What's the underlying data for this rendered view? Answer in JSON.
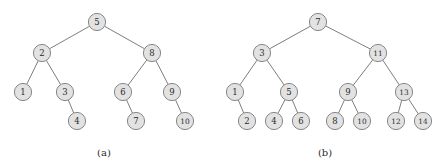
{
  "figure": {
    "background_color": "#ffffff",
    "node_fill_color": "#e2e2e2",
    "node_stroke_color": "#7a7a7a",
    "edge_color": "#6e6e6e",
    "text_color": "#2b2b2b",
    "node_radius": 8.6
  },
  "chart_data": {
    "type": "diagram",
    "title": "",
    "subtitle": "",
    "xlabel": "",
    "ylabel": "",
    "diagram_kind": "binary-tree",
    "panels": [
      {
        "id": "panel-a",
        "caption": "(a)",
        "caption_x": 104,
        "caption_y": 152,
        "root": 5,
        "nodes": [
          {
            "id": "a5",
            "label": "5",
            "x": 97,
            "y": 22
          },
          {
            "id": "a2",
            "label": "2",
            "x": 42,
            "y": 53
          },
          {
            "id": "a8",
            "label": "8",
            "x": 152,
            "y": 53
          },
          {
            "id": "a1",
            "label": "1",
            "x": 23,
            "y": 92
          },
          {
            "id": "a3",
            "label": "3",
            "x": 65,
            "y": 92
          },
          {
            "id": "a6",
            "label": "6",
            "x": 123,
            "y": 92
          },
          {
            "id": "a9",
            "label": "9",
            "x": 172,
            "y": 92
          },
          {
            "id": "a4",
            "label": "4",
            "x": 77,
            "y": 121
          },
          {
            "id": "a7",
            "label": "7",
            "x": 136,
            "y": 121
          },
          {
            "id": "a10",
            "label": "10",
            "x": 185,
            "y": 121
          }
        ],
        "edges": [
          {
            "from": "a5",
            "to": "a2"
          },
          {
            "from": "a5",
            "to": "a8"
          },
          {
            "from": "a2",
            "to": "a1"
          },
          {
            "from": "a2",
            "to": "a3"
          },
          {
            "from": "a8",
            "to": "a6"
          },
          {
            "from": "a8",
            "to": "a9"
          },
          {
            "from": "a3",
            "to": "a4"
          },
          {
            "from": "a6",
            "to": "a7"
          },
          {
            "from": "a9",
            "to": "a10"
          }
        ]
      },
      {
        "id": "panel-b",
        "caption": "(b)",
        "caption_x": 325,
        "caption_y": 152,
        "root": 7,
        "nodes": [
          {
            "id": "b7",
            "label": "7",
            "x": 318,
            "y": 22
          },
          {
            "id": "b3",
            "label": "3",
            "x": 262,
            "y": 53
          },
          {
            "id": "b11",
            "label": "11",
            "x": 378,
            "y": 53
          },
          {
            "id": "b1",
            "label": "1",
            "x": 235,
            "y": 92
          },
          {
            "id": "b5",
            "label": "5",
            "x": 289,
            "y": 92
          },
          {
            "id": "b9",
            "label": "9",
            "x": 348,
            "y": 92
          },
          {
            "id": "b13",
            "label": "13",
            "x": 404,
            "y": 92
          },
          {
            "id": "b2",
            "label": "2",
            "x": 247,
            "y": 121
          },
          {
            "id": "b4",
            "label": "4",
            "x": 274,
            "y": 121
          },
          {
            "id": "b6",
            "label": "6",
            "x": 301,
            "y": 121
          },
          {
            "id": "b8",
            "label": "8",
            "x": 335,
            "y": 121
          },
          {
            "id": "b10",
            "label": "10",
            "x": 362,
            "y": 121
          },
          {
            "id": "b12",
            "label": "12",
            "x": 396,
            "y": 121
          },
          {
            "id": "b14",
            "label": "14",
            "x": 423,
            "y": 121
          }
        ],
        "edges": [
          {
            "from": "b7",
            "to": "b3"
          },
          {
            "from": "b7",
            "to": "b11"
          },
          {
            "from": "b3",
            "to": "b1"
          },
          {
            "from": "b3",
            "to": "b5"
          },
          {
            "from": "b11",
            "to": "b9"
          },
          {
            "from": "b11",
            "to": "b13"
          },
          {
            "from": "b1",
            "to": "b2"
          },
          {
            "from": "b5",
            "to": "b4"
          },
          {
            "from": "b5",
            "to": "b6"
          },
          {
            "from": "b9",
            "to": "b8"
          },
          {
            "from": "b9",
            "to": "b10"
          },
          {
            "from": "b13",
            "to": "b12"
          },
          {
            "from": "b13",
            "to": "b14"
          }
        ]
      }
    ]
  }
}
